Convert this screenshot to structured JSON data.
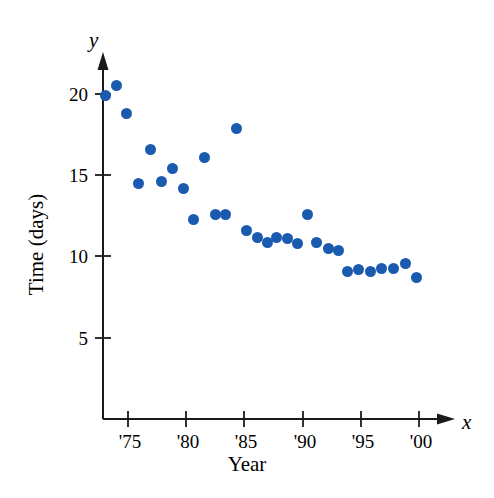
{
  "figure": {
    "x_axis_variable": "x",
    "y_axis_variable": "y",
    "xlabel": "Year",
    "ylabel": "Time (days)",
    "point_color": "#1a5bb0",
    "axis_color": "#1a1a1a"
  },
  "chart_data": {
    "type": "scatter",
    "title": "",
    "xlabel": "Year",
    "ylabel": "Time (days)",
    "x_axis_variable": "x",
    "y_axis_variable": "y",
    "xlim": [
      72.5,
      101.5
    ],
    "ylim": [
      0,
      22.5
    ],
    "xticks": [
      75,
      80,
      85,
      90,
      95,
      100
    ],
    "xticklabels": [
      "'75",
      "'80",
      "'85",
      "'90",
      "'95",
      "'00"
    ],
    "yticks": [
      5,
      10,
      15,
      20
    ],
    "yticklabels": [
      "5",
      "10",
      "15",
      "20"
    ],
    "grid": false,
    "legend": null,
    "series": [
      {
        "name": "Time (days)",
        "color": "#1a5bb0",
        "x": [
          73.1,
          74.0,
          74.9,
          75.9,
          76.9,
          77.9,
          78.8,
          79.8,
          80.6,
          81.6,
          82.5,
          83.4,
          84.3,
          85.2,
          86.1,
          87.0,
          87.8,
          88.7,
          89.6,
          90.4,
          91.2,
          92.2,
          93.1,
          93.9,
          94.8,
          95.8,
          96.8,
          97.8,
          98.8,
          99.8
        ],
        "y": [
          19.9,
          20.5,
          18.8,
          14.5,
          16.6,
          14.6,
          15.4,
          14.2,
          12.3,
          16.1,
          12.6,
          12.6,
          17.9,
          11.6,
          11.2,
          10.9,
          11.2,
          11.1,
          10.8,
          12.6,
          10.9,
          10.5,
          10.4,
          9.1,
          9.2,
          9.1,
          9.3,
          9.3,
          9.6,
          8.7
        ]
      }
    ]
  }
}
